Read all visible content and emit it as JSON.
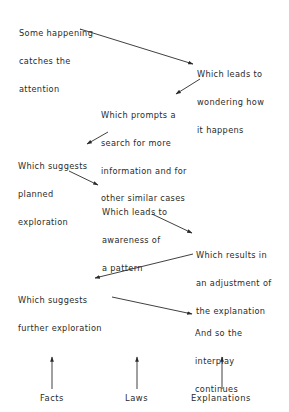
{
  "diagram": {
    "nodes": [
      {
        "id": "n1",
        "lines": [
          "Some happening",
          "catches the",
          "attention"
        ],
        "x": 19,
        "y": 11
      },
      {
        "id": "n2",
        "lines": [
          "Which leads to",
          "wondering how",
          "it happens"
        ],
        "x": 197,
        "y": 52
      },
      {
        "id": "n3",
        "lines": [
          "Which prompts a",
          "search for more",
          "information and for",
          "other similar cases"
        ],
        "x": 101,
        "y": 93
      },
      {
        "id": "n4",
        "lines": [
          "Which suggests",
          "planned",
          "exploration"
        ],
        "x": 18,
        "y": 144
      },
      {
        "id": "n5",
        "lines": [
          "Which leads to",
          "awareness of",
          "a pattern"
        ],
        "x": 102,
        "y": 190
      },
      {
        "id": "n6",
        "lines": [
          "Which results in",
          "an adjustment of",
          "the explanation"
        ],
        "x": 196,
        "y": 233
      },
      {
        "id": "n7",
        "lines": [
          "Which suggests",
          "further exploration"
        ],
        "x": 18,
        "y": 278
      },
      {
        "id": "n8",
        "lines": [
          "And so the",
          "interplay",
          "continues"
        ],
        "x": 195,
        "y": 311
      }
    ],
    "arrows": [
      {
        "from": "n1",
        "to": "n2",
        "x1": 80,
        "y1": 29,
        "x2": 193,
        "y2": 64
      },
      {
        "from": "n2",
        "to": "n3",
        "x1": 200,
        "y1": 79,
        "x2": 176,
        "y2": 94
      },
      {
        "from": "n3",
        "to": "n4",
        "x1": 108,
        "y1": 132,
        "x2": 87,
        "y2": 144
      },
      {
        "from": "n4",
        "to": "n5",
        "x1": 69,
        "y1": 171,
        "x2": 98,
        "y2": 185
      },
      {
        "from": "n5",
        "to": "n6",
        "x1": 152,
        "y1": 214,
        "x2": 192,
        "y2": 233
      },
      {
        "from": "n6",
        "to": "n7",
        "x1": 193,
        "y1": 254,
        "x2": 95,
        "y2": 278
      },
      {
        "from": "n7",
        "to": "n8",
        "x1": 112,
        "y1": 297,
        "x2": 192,
        "y2": 314
      }
    ],
    "bottom_axes": [
      {
        "label": "Facts",
        "arrow_x": 52,
        "label_x": 40
      },
      {
        "label": "Laws",
        "arrow_x": 137,
        "label_x": 125
      },
      {
        "label": "Explanations",
        "arrow_x": 222,
        "label_x": 191
      }
    ],
    "bottom_arrow_y_top": 357,
    "bottom_arrow_y_bottom": 389,
    "bottom_label_y": 393
  }
}
